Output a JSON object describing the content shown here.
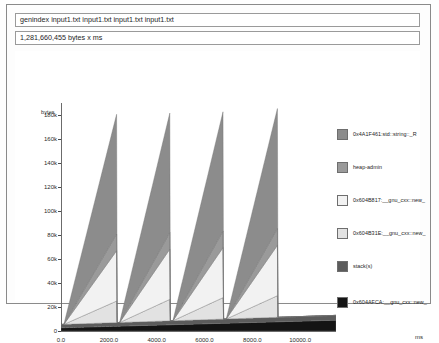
{
  "window": {
    "title": "genindex input1.txt input1.txt input1.txt input1.txt",
    "subtitle": "1,281,660,455 bytes x ms"
  },
  "chart_data": {
    "type": "area",
    "title": "genindex input1.txt input1.txt input1.txt input1.txt",
    "subtitle": "1,281,660,455 bytes x ms",
    "xlabel": "",
    "ylabel": "bytes",
    "xunit": "ms",
    "xlim": [
      0,
      11500
    ],
    "ylim": [
      0,
      190000
    ],
    "xticks": [
      0,
      2000,
      4000,
      6000,
      8000,
      10000
    ],
    "xticklabels": [
      "0.0",
      "2000.0",
      "4000.0",
      "6000.0",
      "8000.0",
      "10000.0"
    ],
    "yticks": [
      0,
      20000,
      40000,
      60000,
      80000,
      100000,
      120000,
      140000,
      160000,
      180000
    ],
    "yticklabels": [
      "0",
      "20k",
      "40k",
      "60k",
      "80k",
      "100k",
      "120k",
      "140k",
      "160k",
      "180k"
    ],
    "grid": false,
    "legend_position": "right",
    "stacked": true,
    "pattern": "sawtooth",
    "peaks": 4,
    "peak_x": [
      2330,
      4560,
      6790,
      9050
    ],
    "peak_total": [
      186000,
      186000,
      186000,
      186000
    ],
    "series": [
      {
        "name": "0x4A1F461:std::string::_R",
        "color": "#8c8c8c",
        "peak_value": 100000,
        "description": "largest stacked band, grey"
      },
      {
        "name": "heap-admin",
        "color": "#9a9a9a",
        "peak_value": 14000,
        "description": "heap administration overhead"
      },
      {
        "name": "0x604B817: __gnu_cxx::new_",
        "color": "#f2f2f2",
        "peak_value": 42000,
        "description": "near-white band"
      },
      {
        "name": "0x604B31E: __gnu_cxx::new_",
        "color": "#e2e2e2",
        "peak_value": 18000,
        "description": "light grey band"
      },
      {
        "name": "stack(s)",
        "color": "#5c5c5c",
        "peak_value": 4000,
        "description": "dark grey band near baseline"
      },
      {
        "name": "0x604AFCA: __gnu_cxx::new_",
        "color": "#141414",
        "peak_value": 9000,
        "description": "black baseline band, grows across time"
      }
    ]
  },
  "legend": {
    "items": [
      {
        "label": "0x4A1F461:std::string::_R",
        "color": "#8c8c8c"
      },
      {
        "label": "heap-admin",
        "color": "#9a9a9a"
      },
      {
        "label": "0x604B817:__gnu_cxx::new_",
        "color": "#f2f2f2"
      },
      {
        "label": "0x604B31E:__gnu_cxx::new_",
        "color": "#e2e2e2"
      },
      {
        "label": "stack(s)",
        "color": "#5c5c5c"
      },
      {
        "label": "0x604AFCA:__gnu_cxx::new_",
        "color": "#141414"
      }
    ]
  }
}
